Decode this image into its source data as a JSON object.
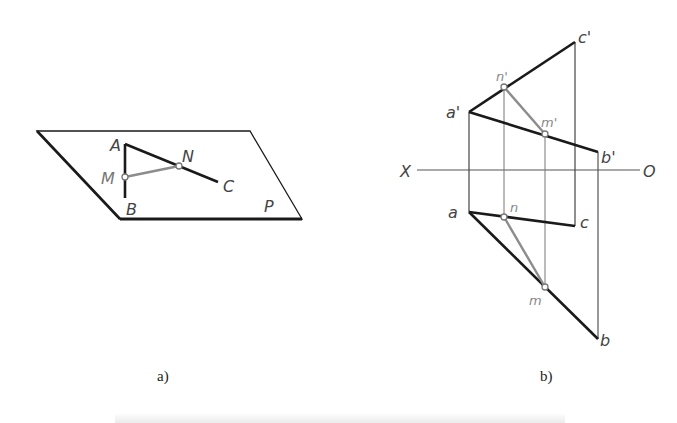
{
  "figure_a": {
    "caption": "a)",
    "plane_label": "P",
    "points": {
      "A": "A",
      "B": "B",
      "C": "C",
      "M": "M",
      "N": "N"
    }
  },
  "figure_b": {
    "caption": "b)",
    "axis": {
      "left": "X",
      "right": "O"
    },
    "upper_points": {
      "a": "a'",
      "b": "b'",
      "c": "c'",
      "m": "m'",
      "n": "n'"
    },
    "lower_points": {
      "a": "a",
      "b": "b",
      "c": "c",
      "m": "m",
      "n": "n"
    }
  },
  "colors": {
    "line": "#1a1a1a",
    "thin": "#555555",
    "grey_line": "#8c8c8c",
    "grey_label": "#8a8a8a"
  }
}
